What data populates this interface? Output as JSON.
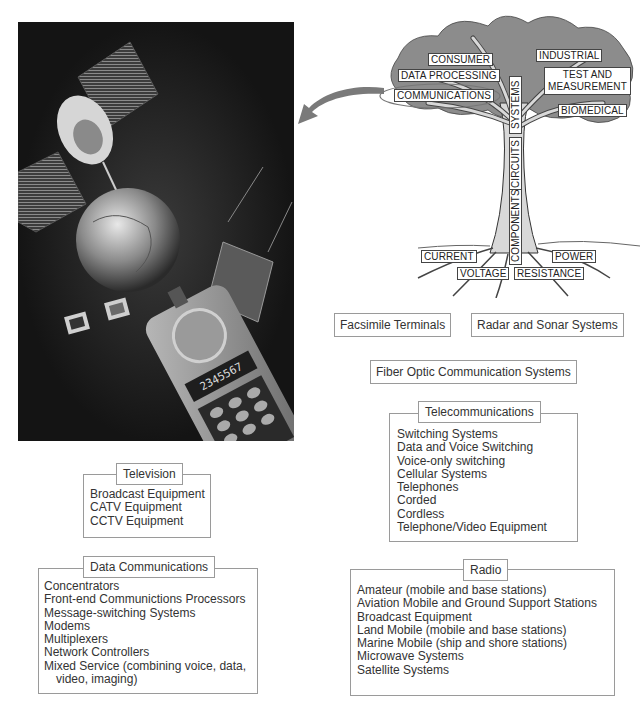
{
  "photo": {
    "subject": "satellite, globe, computers and cellular phone collage",
    "phone_display": "2345567"
  },
  "tree": {
    "branches": [
      {
        "label": "CONSUMER"
      },
      {
        "label": "DATA PROCESSING"
      },
      {
        "label": "COMMUNICATIONS",
        "highlighted": true
      },
      {
        "label": "INDUSTRIAL"
      },
      {
        "label": "TEST AND"
      },
      {
        "label": "MEASUREMENT"
      },
      {
        "label": "BIOMEDICAL"
      }
    ],
    "trunk": [
      {
        "label": "SYSTEMS"
      },
      {
        "label": "CIRCUITS"
      },
      {
        "label": "COMPONENTS"
      }
    ],
    "roots": [
      {
        "label": "CURRENT"
      },
      {
        "label": "VOLTAGE"
      },
      {
        "label": "RESISTANCE"
      },
      {
        "label": "POWER"
      }
    ]
  },
  "arrow": {
    "from": "COMMUNICATIONS",
    "to": "photo"
  },
  "standalone": [
    {
      "label": "Facsimile Terminals"
    },
    {
      "label": "Radar and Sonar Systems"
    },
    {
      "label": "Fiber Optic Communication Systems"
    }
  ],
  "categories": {
    "television": {
      "title": "Television",
      "items": [
        "Broadcast Equipment",
        "CATV Equipment",
        "CCTV Equipment"
      ]
    },
    "data_communications": {
      "title": "Data Communications",
      "items": [
        "Concentrators",
        "Front-end Communictions Processors",
        "Message-switching Systems",
        "Modems",
        "Multiplexers",
        "Network Controllers",
        "Mixed Service (combining voice, data, video, imaging)"
      ]
    },
    "telecommunications": {
      "title": "Telecommunications",
      "items": [
        "Switching Systems",
        "Data and Voice Switching",
        "Voice-only switching",
        "Cellular Systems",
        "Telephones",
        "Corded",
        "Cordless",
        "Telephone/Video Equipment"
      ]
    },
    "radio": {
      "title": "Radio",
      "items": [
        "Amateur (mobile and base stations)",
        "Aviation Mobile and Ground Support Stations",
        "Broadcast Equipment",
        "Land Mobile (mobile and base stations)",
        "Marine Mobile (ship and shore stations)",
        "Microwave Systems",
        "Satellite Systems"
      ]
    }
  },
  "colors": {
    "photo_bg": "#141414",
    "border": "#9a9a9a",
    "arrow": "#7a7a7a",
    "text": "#333333"
  }
}
